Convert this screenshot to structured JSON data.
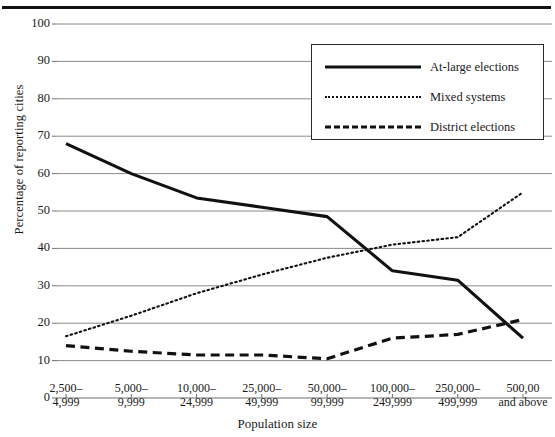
{
  "chart_data": {
    "type": "line",
    "title": "",
    "xlabel": "Population size",
    "ylabel": "Percentage of reporting cities",
    "ylim": [
      0,
      100
    ],
    "ytick_step": 10,
    "yticks": [
      "100",
      "90",
      "80",
      "70",
      "60",
      "50",
      "40",
      "30",
      "20",
      "10",
      "0"
    ],
    "grid": true,
    "legend_position": "top-right-inside",
    "categories": [
      "2,500–\n4,999",
      "5,000–\n9,999",
      "10,000–\n24,999",
      "25,000–\n49,999",
      "50,000–\n99,999",
      "100,000–\n249,999",
      "250,000–\n499,999",
      "500,00\nand above"
    ],
    "categories_lines": [
      [
        "2,500–",
        "4,999"
      ],
      [
        "5,000–",
        "9,999"
      ],
      [
        "10,000–",
        "24,999"
      ],
      [
        "25,000–",
        "49,999"
      ],
      [
        "50,000–",
        "99,999"
      ],
      [
        "100,000–",
        "249,999"
      ],
      [
        "250,000–",
        "499,999"
      ],
      [
        "500,00",
        "and above"
      ]
    ],
    "series": [
      {
        "name": "At-large elections",
        "style": "solid",
        "color": "#111111",
        "values": [
          68,
          60,
          53.5,
          51,
          48.5,
          34,
          31.5,
          16
        ]
      },
      {
        "name": "Mixed systems",
        "style": "dotted",
        "color": "#111111",
        "values": [
          16.5,
          22,
          28,
          33,
          37.5,
          41,
          43,
          55
        ]
      },
      {
        "name": "District elections",
        "style": "dashed",
        "color": "#111111",
        "values": [
          14,
          12.5,
          11.5,
          11.5,
          10.5,
          16,
          17,
          21
        ]
      }
    ]
  },
  "legend": {
    "items": [
      {
        "label": "At-large elections",
        "style": "solid"
      },
      {
        "label": "Mixed systems",
        "style": "dotted"
      },
      {
        "label": "District elections",
        "style": "dashed"
      }
    ]
  },
  "axes": {
    "x_title": "Population size",
    "y_title": "Percentage of reporting cities"
  }
}
